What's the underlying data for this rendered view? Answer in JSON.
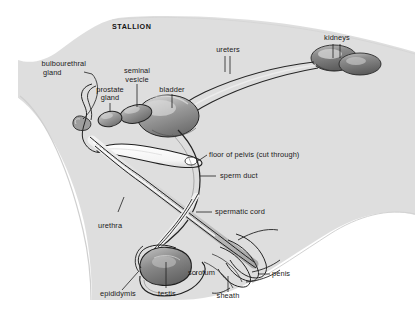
{
  "figure": {
    "title": "STALLION",
    "background_color": "#ffffff",
    "body_silhouette_color": "#d8d8d8",
    "line_color": "#1a1a1a",
    "organ_fill_dark": "#7a7a7a",
    "organ_fill_mid": "#a8a8a8",
    "organ_fill_light": "#e8e8e8"
  },
  "labels": {
    "bulbourethral_gland": "bulbourethral\ngland",
    "bulbourethral_gland_line1": "bulbourethral",
    "bulbourethral_gland_line2": "gland",
    "prostate_gland_line1": "prostate",
    "prostate_gland_line2": "gland",
    "seminal_vesicle_line1": "seminal",
    "seminal_vesicle_line2": "vesicle",
    "bladder": "bladder",
    "ureters": "ureters",
    "kidneys": "kidneys",
    "floor_of_pelvis": "floor of pelvis (cut through)",
    "sperm_duct": "sperm duct",
    "spermatic_cord": "spermatic cord",
    "urethra": "urethra",
    "epididymis": "epididymis",
    "testis": "testis",
    "scrotum": "scrotum",
    "sheath": "sheath",
    "penis": "penis"
  }
}
